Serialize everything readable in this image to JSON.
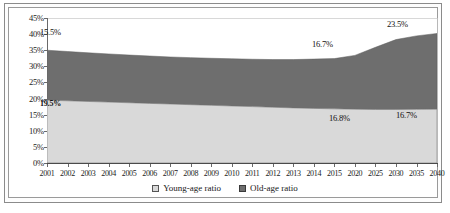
{
  "chart_data": {
    "type": "area",
    "title": "",
    "subtitle": "",
    "xlabel": "",
    "ylabel": "",
    "stacked": true,
    "grid": false,
    "legend_position": "bottom",
    "ylim": [
      0,
      45
    ],
    "ytick_labels": [
      "45%",
      "40%",
      "35%",
      "30%",
      "25%",
      "20%",
      "15%",
      "10%",
      "5%",
      "0%"
    ],
    "ytick_values": [
      45,
      40,
      35,
      30,
      25,
      20,
      15,
      10,
      5,
      0
    ],
    "categories": [
      "2001",
      "2002",
      "2003",
      "2004",
      "2005",
      "2006",
      "2007",
      "2008",
      "2009",
      "2010",
      "2011",
      "2012",
      "2013",
      "2014",
      "2015",
      "2020",
      "2025",
      "2030",
      "2035",
      "2040"
    ],
    "series": [
      {
        "name": "Young-age ratio",
        "color": "#d9d9d9",
        "values": [
          19.5,
          19.3,
          19.1,
          18.9,
          18.7,
          18.5,
          18.3,
          18.1,
          17.9,
          17.7,
          17.5,
          17.3,
          17.1,
          16.95,
          16.8,
          16.7,
          16.6,
          16.6,
          16.65,
          16.7
        ]
      },
      {
        "name": "Old-age ratio",
        "color": "#6e6e6e",
        "values": [
          15.5,
          15.3,
          15.1,
          14.95,
          14.8,
          14.7,
          14.6,
          14.6,
          14.6,
          14.65,
          14.7,
          14.8,
          15.0,
          15.3,
          15.6,
          16.7,
          19.3,
          21.7,
          22.8,
          23.5
        ]
      }
    ],
    "annotations": [
      {
        "label": "15.5%",
        "series": "Old-age ratio",
        "category": "2001",
        "value": 15.5
      },
      {
        "label": "19.5%",
        "series": "Young-age ratio",
        "category": "2001",
        "value": 19.5
      },
      {
        "label": "16.7%",
        "series": "Old-age ratio",
        "category": "2025",
        "value": 16.7
      },
      {
        "label": "23.5%",
        "series": "Old-age ratio",
        "category": "2040",
        "value": 23.5
      },
      {
        "label": "16.8%",
        "series": "Young-age ratio",
        "category": "2015",
        "value": 16.8
      },
      {
        "label": "16.7%",
        "series": "Young-age ratio",
        "category": "2040",
        "value": 16.7
      }
    ],
    "legend": [
      {
        "label": "Young-age ratio",
        "swatch": "light-gray"
      },
      {
        "label": "Old-age ratio",
        "swatch": "dark-gray"
      }
    ]
  },
  "axis": {
    "y": {
      "t0": "45%",
      "t1": "40%",
      "t2": "35%",
      "t3": "30%",
      "t4": "25%",
      "t5": "20%",
      "t6": "15%",
      "t7": "10%",
      "t8": "5%",
      "t9": "0%"
    },
    "x": {
      "y01": "2001",
      "y02": "2002",
      "y03": "2003",
      "y04": "2004",
      "y05": "2005",
      "y06": "2006",
      "y07": "2007",
      "y08": "2008",
      "y09": "2009",
      "y10": "2010",
      "y11": "2011",
      "y12": "2012",
      "y13": "2013",
      "y14": "2014",
      "y15": "2015",
      "y20": "2020",
      "y25": "2025",
      "y30": "2030",
      "y35": "2035",
      "y40": "2040"
    }
  },
  "labels": {
    "old_start": "15.5%",
    "young_start": "19.5%",
    "old_mid": "16.7%",
    "old_end": "23.5%",
    "young_mid": "16.8%",
    "young_end": "16.7%"
  },
  "legend": {
    "young": "Young-age ratio",
    "old": "Old-age ratio"
  },
  "colors": {
    "young_area": "#d9d9d9",
    "old_area": "#6e6e6e",
    "axis": "#4a4a4a",
    "text": "#111111"
  }
}
